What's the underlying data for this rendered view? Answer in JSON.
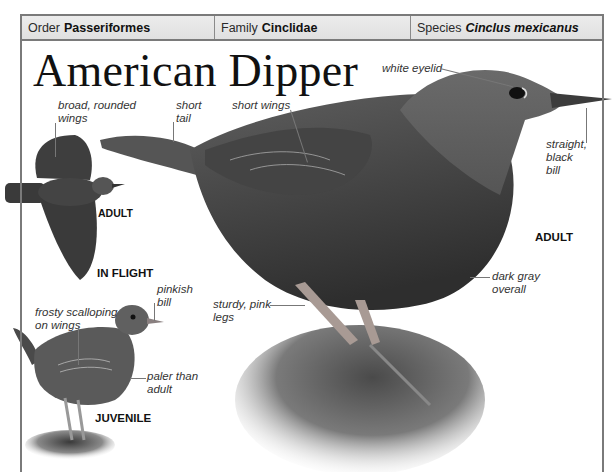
{
  "taxonomy": {
    "order": {
      "label": "Order",
      "value": "Passeriformes"
    },
    "family": {
      "label": "Family",
      "value": "Cinclidae"
    },
    "species": {
      "label": "Species",
      "value": "Cinclus mexicanus"
    }
  },
  "title": "American Dipper",
  "figures": {
    "in_flight": {
      "caption_age": "ADULT",
      "caption_pose": "IN FLIGHT",
      "annotations": {
        "wings": [
          "broad, rounded",
          "wings"
        ]
      }
    },
    "adult": {
      "caption": "ADULT",
      "annotations": {
        "tail": [
          "short",
          "tail"
        ],
        "wings": [
          "short wings"
        ],
        "eyelid": [
          "white eyelid"
        ],
        "bill": [
          "straight,",
          "black",
          "bill"
        ],
        "plumage": [
          "dark gray",
          "overall"
        ],
        "legs": [
          "sturdy, pink",
          "legs"
        ]
      }
    },
    "juvenile": {
      "caption": "JUVENILE",
      "annotations": {
        "wings": [
          "frosty scalloping",
          "on wings"
        ],
        "bill": [
          "pinkish",
          "bill"
        ],
        "plumage": [
          "paler than",
          "adult"
        ]
      }
    }
  },
  "colors": {
    "frame": "#7a7a7a",
    "header_bg": "#e6e6e6",
    "bird_dark": "#3a3a3a",
    "bird_mid": "#5a5a5a",
    "rock": "#6e6e6e"
  }
}
